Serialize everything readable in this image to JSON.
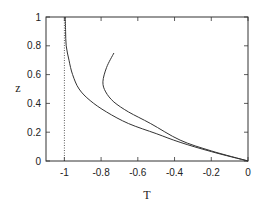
{
  "chart_data": {
    "type": "line",
    "title": "",
    "xlabel": "T",
    "ylabel": "z",
    "xlim": [
      -1.1,
      0
    ],
    "ylim": [
      0,
      1
    ],
    "grid": false,
    "legend": null,
    "x_ticks": [
      "-1",
      "-0.8",
      "-0.6",
      "-0.4",
      "-0.2",
      "0"
    ],
    "y_ticks": [
      "0",
      "0.2",
      "0.4",
      "0.6",
      "0.8",
      "1"
    ],
    "series": [
      {
        "name": "curve-1",
        "style": "solid",
        "points": [
          [
            -0.995,
            1.0
          ],
          [
            -0.993,
            0.9
          ],
          [
            -0.99,
            0.8
          ],
          [
            -0.975,
            0.7
          ],
          [
            -0.955,
            0.6
          ],
          [
            -0.92,
            0.5
          ],
          [
            -0.86,
            0.42
          ],
          [
            -0.77,
            0.34
          ],
          [
            -0.65,
            0.26
          ],
          [
            -0.5,
            0.19
          ],
          [
            -0.37,
            0.13
          ],
          [
            -0.2,
            0.065
          ],
          [
            0.0,
            0.0
          ]
        ]
      },
      {
        "name": "curve-2",
        "style": "solid",
        "points": [
          [
            -0.73,
            0.75
          ],
          [
            -0.77,
            0.65
          ],
          [
            -0.79,
            0.55
          ],
          [
            -0.775,
            0.48
          ],
          [
            -0.73,
            0.41
          ],
          [
            -0.65,
            0.34
          ],
          [
            -0.53,
            0.26
          ],
          [
            -0.37,
            0.145
          ],
          [
            -0.2,
            0.07
          ],
          [
            0.0,
            0.0
          ]
        ]
      },
      {
        "name": "asymptote",
        "style": "dotted",
        "points": [
          [
            -1.0,
            0.0
          ],
          [
            -1.0,
            1.0
          ]
        ]
      }
    ]
  }
}
